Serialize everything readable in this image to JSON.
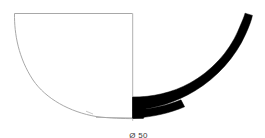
{
  "drawing": {
    "type": "archaeological-pottery-profile",
    "title": "Vessel profile section drawing",
    "background_color": "#ffffff",
    "outline_color": "#9a9a9a",
    "section_fill_color": "#000000",
    "axis_color": "#a8a8a8"
  },
  "annotations": {
    "diameter_label": "Ø 50",
    "diameter_symbol": "Ø",
    "diameter_value": "50"
  },
  "geometry": {
    "axis_x": 133,
    "rim_y": 13,
    "base_y": 118,
    "left_rim_x": 14,
    "section_top_y": 13,
    "section_outer_x": 252
  }
}
